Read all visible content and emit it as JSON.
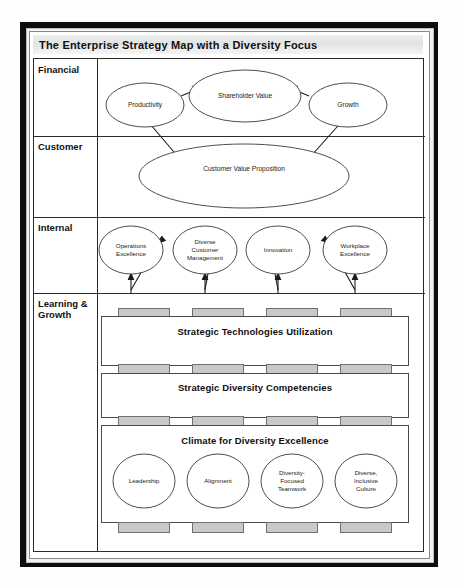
{
  "diagram": {
    "title": "The Enterprise Strategy Map with a Diversity Focus",
    "perspectives": [
      {
        "id": "financial",
        "label": "Financial"
      },
      {
        "id": "customer",
        "label": "Customer"
      },
      {
        "id": "internal",
        "label": "Internal"
      },
      {
        "id": "learning_growth",
        "label": "Learning & Growth"
      }
    ],
    "financial": {
      "nodes": [
        {
          "id": "productivity",
          "label": "Productivity"
        },
        {
          "id": "shareholder_value",
          "label": "Shareholder Value"
        },
        {
          "id": "growth",
          "label": "Growth"
        }
      ]
    },
    "customer": {
      "nodes": [
        {
          "id": "customer_value_proposition",
          "label": "Customer Value Proposition"
        }
      ]
    },
    "internal": {
      "nodes": [
        {
          "id": "operations_excellence",
          "line1": "Operations",
          "line2": "Excellence",
          "line3": ""
        },
        {
          "id": "diverse_customer_management",
          "line1": "Diverse",
          "line2": "Customer",
          "line3": "Management"
        },
        {
          "id": "innovation",
          "line1": "Innovation",
          "line2": "",
          "line3": ""
        },
        {
          "id": "workplace_excellence",
          "line1": "Workplace",
          "line2": "Excellence",
          "line3": ""
        }
      ]
    },
    "learning_growth": {
      "bands": [
        {
          "id": "strategic_technologies_utilization",
          "label": "Strategic Technologies Utilization"
        },
        {
          "id": "strategic_diversity_competencies",
          "label": "Strategic Diversity Competencies"
        },
        {
          "id": "climate_for_diversity_excellence",
          "label": "Climate for Diversity Excellence"
        }
      ],
      "enablers": [
        {
          "id": "leadership",
          "line1": "Leadership",
          "line2": "",
          "line3": ""
        },
        {
          "id": "alignment",
          "line1": "Alignment",
          "line2": "",
          "line3": ""
        },
        {
          "id": "diversity_focused_teamwork",
          "line1": "Diversity-",
          "line2": "Focused",
          "line3": "Teamwork"
        },
        {
          "id": "diverse_inclusive_culture",
          "line1": "Diverse,",
          "line2": "Inclusive",
          "line3": "Culture"
        }
      ]
    },
    "colors": {
      "frame": "#0d0d0d",
      "title_band": "#e6e7e7",
      "grid_line": "#2b2b2b",
      "tab_fill": "#c9c9c9",
      "node_stroke": "#3a3a3a",
      "text": "#101010"
    }
  }
}
